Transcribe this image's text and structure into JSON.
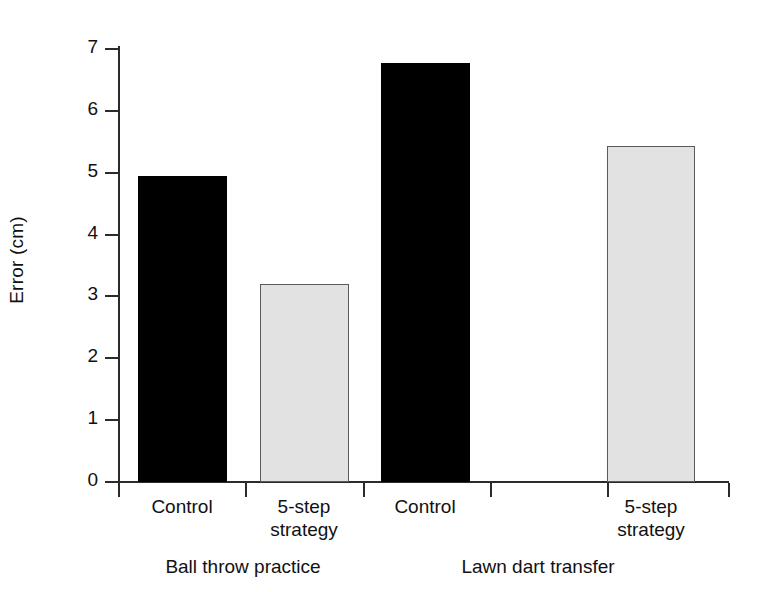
{
  "chart_data": {
    "type": "bar",
    "title": "",
    "xlabel": "",
    "ylabel": "Error (cm)",
    "ylim": [
      0,
      7
    ],
    "ytick_labels": [
      "7",
      "6",
      "5",
      "4",
      "3",
      "2",
      "1",
      "0"
    ],
    "ytick_values": [
      7,
      6,
      5,
      4,
      3,
      2,
      1,
      0
    ],
    "grid": false,
    "legend": "none",
    "categories": [
      "Control",
      "5-step strategy",
      "Control",
      "5-step strategy"
    ],
    "groups": [
      {
        "label": "Ball throw practice",
        "bars": [
          {
            "category": "Control",
            "line1": "Control",
            "line2": "",
            "value": 4.94,
            "fill": "dark"
          },
          {
            "category": "5-step strategy",
            "line1": "5-step",
            "line2": "strategy",
            "value": 3.2,
            "fill": "light"
          }
        ]
      },
      {
        "label": "Lawn dart transfer",
        "bars": [
          {
            "category": "Control",
            "line1": "Control",
            "line2": "",
            "value": 6.77,
            "fill": "dark"
          },
          {
            "category": "5-step strategy",
            "line1": "5-step",
            "line2": "strategy",
            "value": 5.43,
            "fill": "light"
          }
        ]
      }
    ],
    "series": [
      {
        "name": "Error (cm)",
        "values": [
          4.94,
          3.2,
          6.77,
          5.43
        ]
      }
    ],
    "colors": {
      "dark_bar": "#000000",
      "light_bar": "#e2e2e2",
      "bar_border": "#5a5a5a",
      "axis": "#2b2b2b",
      "text": "#111111",
      "background": "#ffffff"
    }
  }
}
